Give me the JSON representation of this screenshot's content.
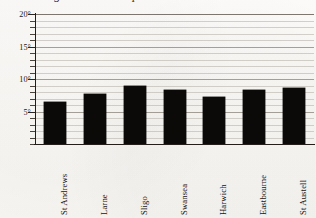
{
  "chart_data": {
    "type": "bar",
    "title": "Average summer temperature",
    "title_clipped": true,
    "categories": [
      "St Andrews",
      "Larne",
      "Sligo",
      "Swansea",
      "Harwich",
      "Eastbourne",
      "St Austell"
    ],
    "values": [
      6.5,
      7.7,
      8.9,
      8.3,
      7.3,
      8.3,
      8.6
    ],
    "xlabel": "",
    "ylabel": "",
    "ylim": [
      0,
      20
    ],
    "ytick_labels": [
      "20°",
      "15°",
      "10°",
      "5°"
    ],
    "ytick_values": [
      20,
      15,
      10,
      5
    ],
    "minor_tick_step": 1,
    "grid": true,
    "grid_axis": "y",
    "legend": null,
    "bar_color": "#0b0a09",
    "grid_color": "#b9b4ad",
    "axis_color": "#231e19",
    "background_color": "#fbfaf8"
  },
  "axes": {
    "y_ticks": [
      {
        "value": 20,
        "label": "20°",
        "major": true
      },
      {
        "value": 19,
        "label": "",
        "major": false
      },
      {
        "value": 18,
        "label": "",
        "major": false
      },
      {
        "value": 17,
        "label": "",
        "major": false
      },
      {
        "value": 16,
        "label": "",
        "major": false
      },
      {
        "value": 15,
        "label": "15°",
        "major": true
      },
      {
        "value": 14,
        "label": "",
        "major": false
      },
      {
        "value": 13,
        "label": "",
        "major": false
      },
      {
        "value": 12,
        "label": "",
        "major": false
      },
      {
        "value": 11,
        "label": "",
        "major": false
      },
      {
        "value": 10,
        "label": "10°",
        "major": true
      },
      {
        "value": 9,
        "label": "",
        "major": false
      },
      {
        "value": 8,
        "label": "",
        "major": false
      },
      {
        "value": 7,
        "label": "",
        "major": false
      },
      {
        "value": 6,
        "label": "",
        "major": false
      },
      {
        "value": 5,
        "label": "5°",
        "major": true
      },
      {
        "value": 4,
        "label": "",
        "major": false
      },
      {
        "value": 3,
        "label": "",
        "major": false
      },
      {
        "value": 2,
        "label": "",
        "major": false
      },
      {
        "value": 1,
        "label": "",
        "major": false
      },
      {
        "value": 0,
        "label": "",
        "major": false
      }
    ]
  },
  "bars": [
    {
      "label": "St Andrews",
      "value": 6.5
    },
    {
      "label": "Larne",
      "value": 7.7
    },
    {
      "label": "Sligo",
      "value": 8.9
    },
    {
      "label": "Swansea",
      "value": 8.3
    },
    {
      "label": "Harwich",
      "value": 7.3
    },
    {
      "label": "Eastbourne",
      "value": 8.3
    },
    {
      "label": "St Austell",
      "value": 8.6
    }
  ]
}
